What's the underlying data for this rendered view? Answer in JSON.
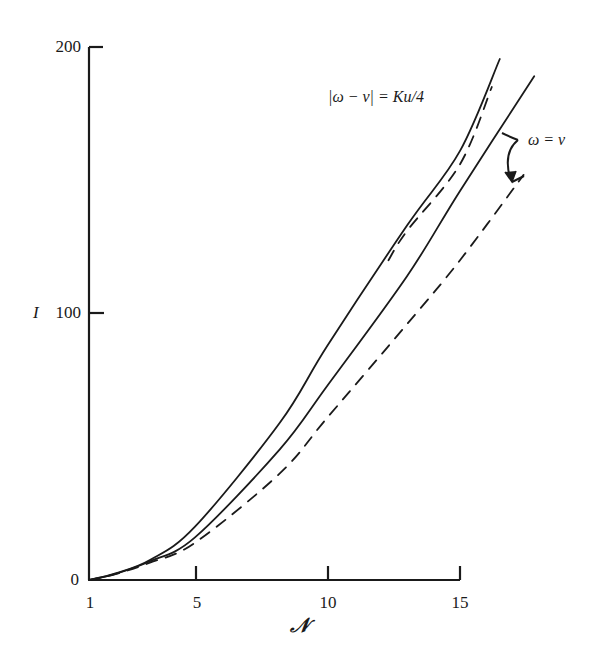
{
  "chart_data": {
    "type": "line",
    "title": "",
    "xlabel": "𝒩",
    "ylabel": "I",
    "xlim": [
      1,
      15
    ],
    "ylim": [
      0,
      200
    ],
    "x_ticks": [
      "1",
      "5",
      "10",
      "15"
    ],
    "y_ticks": [
      "0",
      "100",
      "200"
    ],
    "grid": false,
    "legend": "none (inline annotations)",
    "annotations": [
      {
        "text": "|ω − ν| = Ku/4",
        "target": "upper solid and upper dashed curves"
      },
      {
        "text": "ω = ν",
        "target": "middle solid and lower dashed curves (bracket arrow)"
      }
    ],
    "series": [
      {
        "name": "|ω − ν| = Ku/4 (solid)",
        "style": "solid",
        "x": [
          1,
          2,
          3.3,
          5,
          8.2,
          10,
          13,
          15,
          16.5
        ],
        "y": [
          0,
          2.5,
          7.5,
          20,
          59,
          88,
          133,
          161,
          195.5
        ]
      },
      {
        "name": "|ω − ν| = Ku/4 (dashed)",
        "style": "dashed",
        "x": [
          12.3,
          13,
          15,
          16.2
        ],
        "y": [
          120,
          131,
          156,
          185
        ]
      },
      {
        "name": "ω = ν (solid)",
        "style": "solid",
        "x": [
          1,
          2,
          3.3,
          5,
          8.2,
          10,
          13,
          15,
          17.8
        ],
        "y": [
          0,
          2.3,
          7,
          16,
          49,
          73,
          114,
          146,
          189
        ]
      },
      {
        "name": "ω = ν (dashed)",
        "style": "dashed",
        "x": [
          1,
          2,
          3.3,
          5,
          8.2,
          10,
          13,
          15,
          17.4
        ],
        "y": [
          0,
          2.2,
          6.5,
          14,
          40,
          61,
          96,
          120,
          152
        ]
      }
    ]
  },
  "axes": {
    "y_label": "I",
    "x_label": "𝒩",
    "y_ticks": [
      "200",
      "100",
      "0"
    ],
    "x_ticks": [
      "1",
      "5",
      "10",
      "15"
    ]
  },
  "annotations": {
    "upper": "|ω − ν| = Ku/4",
    "lower": "ω = ν"
  }
}
